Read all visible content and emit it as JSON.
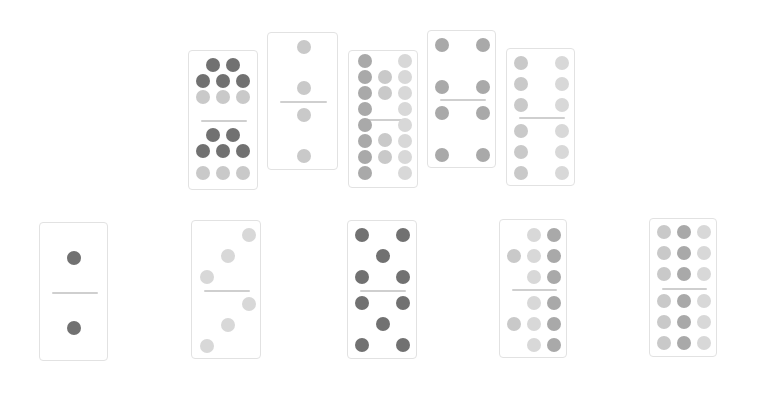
{
  "colors": {
    "dark": "#717171",
    "medium": "#a9a9a9",
    "light": "#c9c9c9",
    "lighter": "#d8d8d8",
    "divider": "#cfcfcf",
    "border": "#e2e2e2"
  },
  "dominoes": [
    {
      "id": "top-1",
      "value": "8|8",
      "x": 188,
      "y": 50,
      "w": 70,
      "h": 140,
      "pips": [
        [
          24,
          14,
          "dark"
        ],
        [
          44,
          14,
          "dark"
        ],
        [
          14,
          30,
          "dark"
        ],
        [
          34,
          30,
          "dark"
        ],
        [
          54,
          30,
          "dark"
        ],
        [
          14,
          46,
          "light"
        ],
        [
          34,
          46,
          "light"
        ],
        [
          54,
          46,
          "light"
        ],
        [
          24,
          84,
          "dark"
        ],
        [
          44,
          84,
          "dark"
        ],
        [
          14,
          100,
          "dark"
        ],
        [
          34,
          100,
          "dark"
        ],
        [
          54,
          100,
          "dark"
        ],
        [
          14,
          122,
          "light"
        ],
        [
          34,
          122,
          "light"
        ],
        [
          54,
          122,
          "light"
        ]
      ]
    },
    {
      "id": "top-2",
      "value": "2|2",
      "x": 267,
      "y": 32,
      "w": 71,
      "h": 138,
      "pips": [
        [
          36,
          14,
          "light"
        ],
        [
          36,
          55,
          "light"
        ],
        [
          36,
          82,
          "light"
        ],
        [
          36,
          123,
          "light"
        ]
      ]
    },
    {
      "id": "top-3",
      "value": "10|10",
      "x": 348,
      "y": 50,
      "w": 70,
      "h": 138,
      "pips": [
        [
          16,
          10,
          "medium"
        ],
        [
          56,
          10,
          "lighter"
        ],
        [
          16,
          26,
          "medium"
        ],
        [
          36,
          26,
          "light"
        ],
        [
          56,
          26,
          "lighter"
        ],
        [
          16,
          42,
          "medium"
        ],
        [
          36,
          42,
          "light"
        ],
        [
          56,
          42,
          "lighter"
        ],
        [
          16,
          58,
          "medium"
        ],
        [
          56,
          58,
          "lighter"
        ],
        [
          16,
          74,
          "medium"
        ],
        [
          56,
          74,
          "lighter"
        ],
        [
          16,
          90,
          "medium"
        ],
        [
          36,
          89,
          "light"
        ],
        [
          56,
          90,
          "lighter"
        ],
        [
          16,
          106,
          "medium"
        ],
        [
          36,
          106,
          "light"
        ],
        [
          56,
          106,
          "lighter"
        ],
        [
          16,
          122,
          "medium"
        ],
        [
          56,
          122,
          "lighter"
        ]
      ]
    },
    {
      "id": "top-4",
      "value": "4|4",
      "x": 427,
      "y": 30,
      "w": 69,
      "h": 138,
      "pips": [
        [
          14,
          14,
          "medium"
        ],
        [
          55,
          14,
          "medium"
        ],
        [
          14,
          56,
          "medium"
        ],
        [
          55,
          56,
          "medium"
        ],
        [
          14,
          82,
          "medium"
        ],
        [
          55,
          82,
          "medium"
        ],
        [
          14,
          124,
          "medium"
        ],
        [
          55,
          124,
          "medium"
        ]
      ]
    },
    {
      "id": "top-5",
      "value": "6|6",
      "x": 506,
      "y": 48,
      "w": 69,
      "h": 138,
      "pips": [
        [
          14,
          14,
          "light"
        ],
        [
          55,
          14,
          "lighter"
        ],
        [
          14,
          35,
          "light"
        ],
        [
          55,
          35,
          "lighter"
        ],
        [
          14,
          56,
          "light"
        ],
        [
          55,
          56,
          "lighter"
        ],
        [
          14,
          82,
          "light"
        ],
        [
          55,
          82,
          "lighter"
        ],
        [
          14,
          103,
          "light"
        ],
        [
          55,
          103,
          "lighter"
        ],
        [
          14,
          124,
          "light"
        ],
        [
          55,
          124,
          "lighter"
        ]
      ]
    },
    {
      "id": "bottom-1",
      "value": "1|1",
      "x": 39,
      "y": 222,
      "w": 69,
      "h": 139,
      "pips": [
        [
          34,
          35,
          "dark"
        ],
        [
          34,
          105,
          "dark"
        ]
      ]
    },
    {
      "id": "bottom-2",
      "value": "3|3",
      "x": 191,
      "y": 220,
      "w": 70,
      "h": 139,
      "pips": [
        [
          57,
          14,
          "lighter"
        ],
        [
          36,
          35,
          "lighter"
        ],
        [
          15,
          56,
          "lighter"
        ],
        [
          57,
          83,
          "lighter"
        ],
        [
          36,
          104,
          "lighter"
        ],
        [
          15,
          125,
          "lighter"
        ]
      ]
    },
    {
      "id": "bottom-3",
      "value": "5|5",
      "x": 347,
      "y": 220,
      "w": 70,
      "h": 139,
      "pips": [
        [
          14,
          14,
          "dark"
        ],
        [
          55,
          14,
          "dark"
        ],
        [
          35,
          35,
          "dark"
        ],
        [
          14,
          56,
          "dark"
        ],
        [
          55,
          56,
          "dark"
        ],
        [
          14,
          82,
          "dark"
        ],
        [
          55,
          82,
          "dark"
        ],
        [
          35,
          103,
          "dark"
        ],
        [
          14,
          124,
          "dark"
        ],
        [
          55,
          124,
          "dark"
        ]
      ]
    },
    {
      "id": "bottom-4",
      "value": "7|7",
      "x": 499,
      "y": 219,
      "w": 68,
      "h": 139,
      "pips": [
        [
          34,
          15,
          "lighter"
        ],
        [
          54,
          15,
          "medium"
        ],
        [
          14,
          36,
          "light"
        ],
        [
          34,
          36,
          "lighter"
        ],
        [
          54,
          36,
          "medium"
        ],
        [
          34,
          57,
          "lighter"
        ],
        [
          54,
          57,
          "medium"
        ],
        [
          34,
          83,
          "lighter"
        ],
        [
          54,
          83,
          "medium"
        ],
        [
          14,
          104,
          "light"
        ],
        [
          34,
          104,
          "lighter"
        ],
        [
          54,
          104,
          "medium"
        ],
        [
          34,
          125,
          "lighter"
        ],
        [
          54,
          125,
          "medium"
        ]
      ]
    },
    {
      "id": "bottom-5",
      "value": "9|9",
      "x": 649,
      "y": 218,
      "w": 68,
      "h": 139,
      "pips": [
        [
          14,
          13,
          "light"
        ],
        [
          34,
          13,
          "medium"
        ],
        [
          54,
          13,
          "lighter"
        ],
        [
          14,
          34,
          "light"
        ],
        [
          34,
          34,
          "medium"
        ],
        [
          54,
          34,
          "lighter"
        ],
        [
          14,
          55,
          "light"
        ],
        [
          34,
          55,
          "medium"
        ],
        [
          54,
          55,
          "lighter"
        ],
        [
          14,
          82,
          "light"
        ],
        [
          34,
          82,
          "medium"
        ],
        [
          54,
          82,
          "lighter"
        ],
        [
          14,
          103,
          "light"
        ],
        [
          34,
          103,
          "medium"
        ],
        [
          54,
          103,
          "lighter"
        ],
        [
          14,
          124,
          "light"
        ],
        [
          34,
          124,
          "medium"
        ],
        [
          54,
          124,
          "lighter"
        ]
      ]
    }
  ]
}
